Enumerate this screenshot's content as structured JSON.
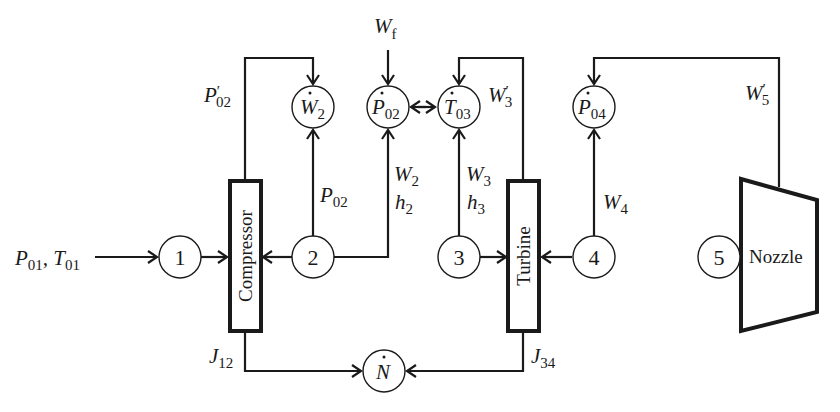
{
  "diagram": {
    "type": "gas-turbine-engine-block-diagram",
    "components": {
      "compressor": "Compressor",
      "turbine": "Turbine",
      "nozzle": "Nozzle"
    },
    "stations": [
      "1",
      "2",
      "3",
      "4",
      "5"
    ],
    "inputs": {
      "inlet": {
        "p": "P",
        "p_sub": "01",
        "sep": ", ",
        "t": "T",
        "t_sub": "01"
      },
      "fuel": {
        "base": "W",
        "sub": "f"
      }
    },
    "state_nodes": {
      "w2dot": {
        "base": "W",
        "sub": "2"
      },
      "p02dot": {
        "base": "P",
        "sub": "02"
      },
      "t03dot": {
        "base": "T",
        "sub": "03"
      },
      "p04dot": {
        "base": "P",
        "sub": "04"
      },
      "ndot": {
        "base": "N",
        "sub": ""
      }
    },
    "signal_labels": {
      "p02_prime": {
        "base": "P",
        "prime": "′",
        "sub": "02"
      },
      "p02": {
        "base": "P",
        "sub": "02"
      },
      "w2": {
        "base": "W",
        "sub": "2"
      },
      "h2": {
        "base": "h",
        "sub": "2"
      },
      "w3_prime": {
        "base": "W",
        "prime": "′",
        "sub": "3"
      },
      "w3": {
        "base": "W",
        "sub": "3"
      },
      "h3": {
        "base": "h",
        "sub": "3"
      },
      "w4": {
        "base": "W",
        "sub": "4"
      },
      "w5_prime": {
        "base": "W",
        "prime": "′",
        "sub": "5"
      },
      "j12": {
        "base": "J",
        "sub": "12"
      },
      "j34": {
        "base": "J",
        "sub": "34"
      }
    },
    "colors": {
      "line": "#1a1a1a",
      "background": "#ffffff"
    }
  }
}
